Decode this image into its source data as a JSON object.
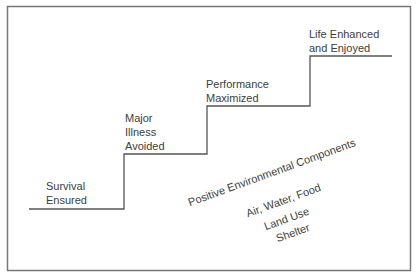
{
  "diagram": {
    "steps": [
      {
        "line1": "Survival",
        "line2": "Ensured"
      },
      {
        "line1": "Major",
        "line2": "Illness",
        "line3": "Avoided"
      },
      {
        "line1": "Performance",
        "line2": "Maximized"
      },
      {
        "line1": "Life Enhanced",
        "line2": "and Enjoyed"
      }
    ],
    "foundation": {
      "title": "Positive Environmental Components",
      "items": [
        "Air, Water, Food",
        "Land Use",
        "Shelter"
      ]
    },
    "colors": {
      "line": "#555555",
      "border": "#777777",
      "text": "#3d3d3d"
    }
  }
}
